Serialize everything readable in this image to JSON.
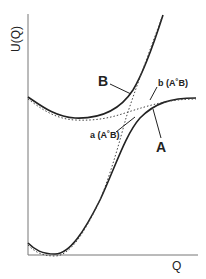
{
  "diagram": {
    "axes": {
      "y_label": "U(Q)",
      "x_label": "Q"
    },
    "curves": [
      {
        "id": "A",
        "label": "A",
        "style": "solid"
      },
      {
        "id": "B",
        "label": "B",
        "style": "solid"
      },
      {
        "id": "a",
        "label": "a (A˚B)",
        "style": "dotted"
      },
      {
        "id": "b",
        "label": "b (A˚B)",
        "style": "dotted"
      }
    ],
    "colors": {
      "line": "#222222",
      "axis": "#666666"
    }
  }
}
